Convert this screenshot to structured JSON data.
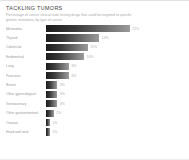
{
  "header": {
    "title": "TACKLING TUMORS",
    "subtitle": "Percentage of cancer clinical trials testing drugs that could be targeted to specific genetic mutations, by type of cancer"
  },
  "chart_data": {
    "type": "bar",
    "orientation": "horizontal",
    "title": "TACKLING TUMORS",
    "subtitle": "Percentage of cancer clinical trials testing drugs that could be targeted to specific genetic mutations, by type of cancer",
    "xlabel": "",
    "ylabel": "",
    "xlim": [
      0,
      25
    ],
    "grid": false,
    "legend": null,
    "categories": [
      "Melanoma",
      "Thyroid",
      "Colorectal",
      "Endometrial",
      "Lung",
      "Pancreas",
      "Breast",
      "Other gynecological",
      "Genitourinary",
      "Other gastrointestinal",
      "Ovarian",
      "Head and neck"
    ],
    "values": [
      22,
      14,
      11,
      10,
      6,
      6,
      3,
      3,
      3,
      2,
      1,
      1
    ],
    "value_labels": [
      "22%",
      "14%",
      "11%",
      "10%",
      "6%",
      "6%",
      "3%",
      "3%",
      "3%",
      "2%",
      "1%",
      "1%"
    ],
    "bar_gradient": {
      "from": "#1c1c1c",
      "to": "#9b9b9b"
    }
  }
}
